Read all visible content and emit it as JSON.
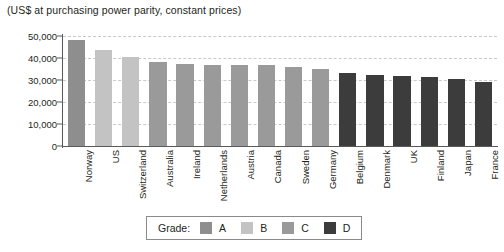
{
  "chart_data": {
    "type": "bar",
    "title": "(US$ at purchasing power parity, constant prices)",
    "subtitle": "",
    "xlabel": "",
    "ylabel": "",
    "ylim": [
      0,
      50000
    ],
    "ytick_labels": [
      "50,000",
      "40,000",
      "30,000",
      "20,000",
      "10,000",
      "0"
    ],
    "ytick_values": [
      50000,
      40000,
      30000,
      20000,
      10000,
      0
    ],
    "grid": true,
    "grid_axis": "y",
    "legend_position": "bottom-center",
    "categories": [
      "Norway",
      "US",
      "Switzerland",
      "Australia",
      "Ireland",
      "Netherlands",
      "Austria",
      "Canada",
      "Sweden",
      "Germany",
      "Belgium",
      "Denmark",
      "UK",
      "Finland",
      "Japan",
      "France"
    ],
    "values": [
      48000,
      43500,
      40500,
      38000,
      37500,
      37000,
      37000,
      36800,
      36000,
      35000,
      33000,
      32500,
      32000,
      31500,
      30500,
      29000
    ],
    "grades": [
      "A",
      "B",
      "B",
      "C",
      "C",
      "C",
      "C",
      "C",
      "C",
      "C",
      "D",
      "D",
      "D",
      "D",
      "D",
      "D"
    ],
    "grade_colors": {
      "A": "#8e8e8e",
      "B": "#c3c3c3",
      "C": "#9a9a9a",
      "D": "#3c3c3c"
    },
    "bar_colors": [
      "#8e8e8e",
      "#c3c3c3",
      "#c3c3c3",
      "#9a9a9a",
      "#9a9a9a",
      "#9a9a9a",
      "#9a9a9a",
      "#9a9a9a",
      "#9a9a9a",
      "#9a9a9a",
      "#3c3c3c",
      "#3c3c3c",
      "#3c3c3c",
      "#3c3c3c",
      "#3c3c3c",
      "#3c3c3c"
    ]
  },
  "legend": {
    "title": "Grade:",
    "entries": [
      {
        "label": "A",
        "color": "#8e8e8e"
      },
      {
        "label": "B",
        "color": "#c3c3c3"
      },
      {
        "label": "C",
        "color": "#9a9a9a"
      },
      {
        "label": "D",
        "color": "#3c3c3c"
      }
    ]
  },
  "axis": {
    "line_color": "#5a5a5a",
    "grid_color": "#c9c9c9"
  }
}
